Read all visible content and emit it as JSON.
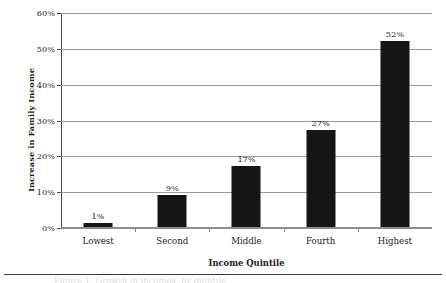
{
  "chart_data": {
    "type": "bar",
    "title": "",
    "subtitle": "",
    "xlabel": "Income Quintile",
    "ylabel": "Increase in Family Income",
    "categories": [
      "Lowest",
      "Second",
      "Middle",
      "Fourth",
      "Highest"
    ],
    "values": [
      1,
      9,
      17,
      27,
      52
    ],
    "value_labels": [
      "1%",
      "9%",
      "17%",
      "27%",
      "52%"
    ],
    "ylim": [
      0,
      60
    ],
    "ytick_values": [
      0,
      10,
      20,
      30,
      40,
      50,
      60
    ],
    "ytick_labels": [
      "0%",
      "10%",
      "20%",
      "30%",
      "40%",
      "50%",
      "60%"
    ],
    "grid": true,
    "grid_orientation": "horizontal",
    "legend": false,
    "legend_position": "none",
    "bar_color": "#151515",
    "gridline_color": "#9a9a9a",
    "axis_color": "#4a4a4a",
    "background_color": "#ffffff",
    "orientation": "vertical",
    "units": "percent"
  },
  "figure": {
    "caption_sliver": "Figure 1. Growth in incomes, by quintile"
  }
}
